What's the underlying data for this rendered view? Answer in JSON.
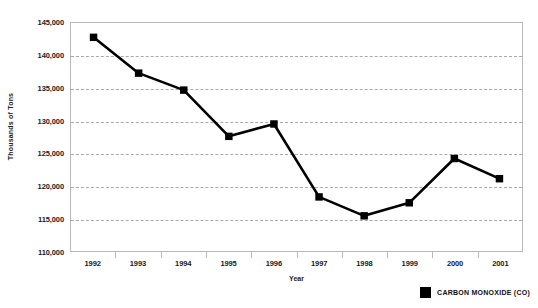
{
  "chart_data": {
    "type": "line",
    "title": "",
    "xlabel": "Year",
    "ylabel": "Thousands of Tons",
    "categories": [
      "1992",
      "1993",
      "1994",
      "1995",
      "1996",
      "1997",
      "1998",
      "1999",
      "2000",
      "2001"
    ],
    "series": [
      {
        "name": "CARBON MONOXIDE (CO)",
        "color": "#000000",
        "marker": "square",
        "values": [
          142800,
          137300,
          134700,
          127600,
          129500,
          118300,
          115400,
          117400,
          124200,
          121100
        ]
      }
    ],
    "ylim": [
      110000,
      145000
    ],
    "yticks": [
      110000,
      115000,
      120000,
      125000,
      130000,
      135000,
      140000,
      145000
    ],
    "ytick_labels": [
      "110,000",
      "115,000",
      "120,000",
      "125,000",
      "130,000",
      "135,000",
      "140,000",
      "145,000"
    ],
    "grid": true,
    "grid_style": "dashed-horizontal",
    "legend_position": "bottom-right"
  },
  "legend": {
    "entries": [
      {
        "label": "CARBON MONOXIDE (CO)",
        "color": "#000000",
        "swatch": "square-marker"
      }
    ]
  },
  "axes": {
    "y_title": "Thousands of Tons",
    "x_title": "Year"
  }
}
